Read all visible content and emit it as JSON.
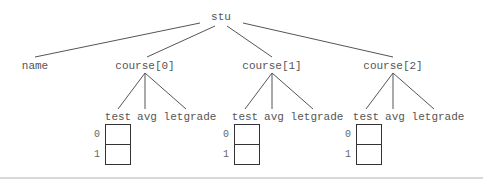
{
  "diagram": {
    "root": {
      "label": "stu"
    },
    "children": [
      {
        "label": "name"
      },
      {
        "label": "course[0]",
        "fields": [
          "test",
          "avg",
          "letgrade"
        ],
        "array_indices": [
          "0",
          "1"
        ]
      },
      {
        "label": "course[1]",
        "fields": [
          "test",
          "avg",
          "letgrade"
        ],
        "array_indices": [
          "0",
          "1"
        ]
      },
      {
        "label": "course[2]",
        "fields": [
          "test",
          "avg",
          "letgrade"
        ],
        "array_indices": [
          "0",
          "1"
        ]
      }
    ],
    "colors": {
      "line": "#555555",
      "text": "#555555",
      "box": "#333333",
      "rule": "#d8d8d8"
    }
  }
}
